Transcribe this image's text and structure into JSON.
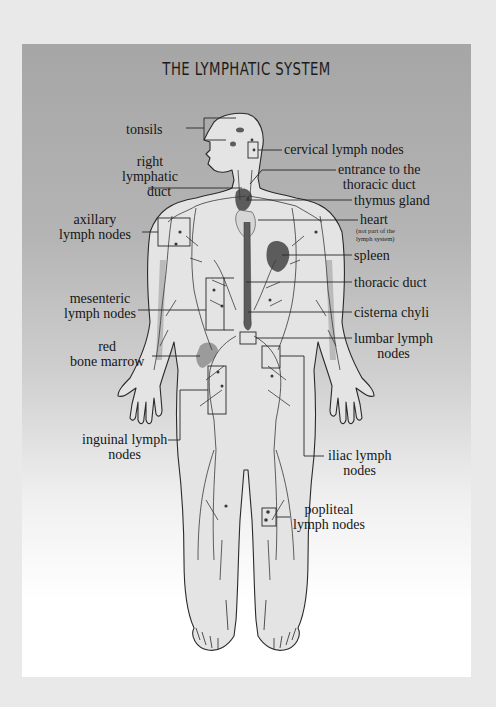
{
  "title": "THE LYMPHATIC SYSTEM",
  "colors": {
    "page_background": "#e9e9e9",
    "panel_top": "#a6a6a6",
    "panel_bottom": "#ffffff",
    "body_fill": "#e4e4e4",
    "organ_fill": "#5c5c5c",
    "bone_fill": "#9a9a9a",
    "outline": "#2a2a2a"
  },
  "labels": {
    "left": [
      {
        "id": "tonsils",
        "text": "tonsils"
      },
      {
        "id": "right_lymphatic_duct",
        "line1": "right",
        "line2": "lymphatic",
        "line3": "duct"
      },
      {
        "id": "axillary_lymph_nodes",
        "line1": "axillary",
        "line2": "lymph nodes"
      },
      {
        "id": "mesenteric_lymph_nodes",
        "line1": "mesenteric",
        "line2": "lymph nodes"
      },
      {
        "id": "red_bone_marrow",
        "line1": "red",
        "line2": "bone marrow"
      },
      {
        "id": "inguinal_lymph_nodes",
        "line1": "inguinal lymph",
        "line2": "nodes"
      }
    ],
    "right": [
      {
        "id": "cervical_lymph_nodes",
        "text": "cervical lymph nodes"
      },
      {
        "id": "entrance_thoracic_duct",
        "line1": "entrance to the",
        "line2": "thoracic duct"
      },
      {
        "id": "thymus_gland",
        "text": "thymus gland"
      },
      {
        "id": "heart",
        "text": "heart",
        "note1": "(not part of the",
        "note2": "lymph system)"
      },
      {
        "id": "spleen",
        "text": "spleen"
      },
      {
        "id": "thoracic_duct",
        "text": "thoracic duct"
      },
      {
        "id": "cisterna_chyli",
        "text": "cisterna chyli"
      },
      {
        "id": "lumbar_lymph_nodes",
        "line1": "lumbar lymph",
        "line2": "nodes"
      },
      {
        "id": "iliac_lymph_nodes",
        "line1": "iliac lymph",
        "line2": "nodes"
      },
      {
        "id": "popliteal_lymph_nodes",
        "line1": "popliteal",
        "line2": "lymph nodes"
      }
    ]
  }
}
